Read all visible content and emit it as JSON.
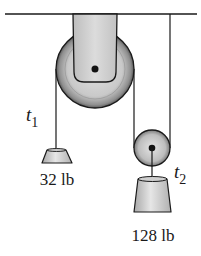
{
  "diagram": {
    "type": "pulley-system",
    "ceiling": {
      "label": ""
    },
    "pulleys": [
      {
        "name": "fixed-pulley",
        "size": "large"
      },
      {
        "name": "movable-pulley",
        "size": "small"
      }
    ],
    "tensions": {
      "t1": {
        "symbol": "t",
        "subscript": "1"
      },
      "t2": {
        "symbol": "t",
        "subscript": "2"
      }
    },
    "weights": [
      {
        "name": "left-weight",
        "label": "32 lb"
      },
      {
        "name": "right-weight",
        "label": "128 lb"
      }
    ],
    "colors": {
      "line": "#1a1a1a",
      "pulley_fill": "#b8b8b8",
      "pulley_light": "#d9d9d9",
      "bracket_fill": "#cfcfcf",
      "weight_fill": "#d0d0d0"
    }
  }
}
